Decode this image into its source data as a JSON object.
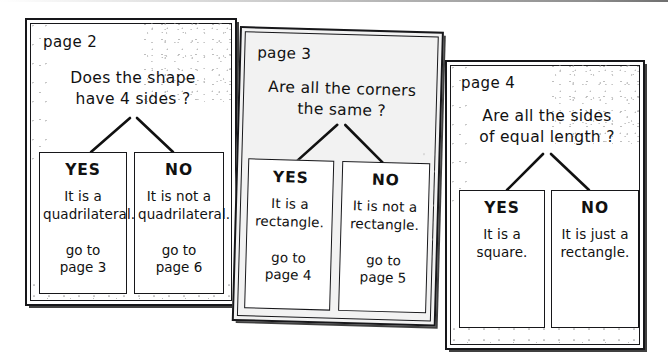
{
  "figure": {
    "kind": "flowchart-pages-scan",
    "ink_color": "#111111",
    "paper_color": "#ffffff",
    "page3_paper_color": "#f2f2f2"
  },
  "cards": [
    {
      "id": "page2",
      "page_label": "page 2",
      "question": "Does the shape\nhave 4 sides ?",
      "answers": [
        {
          "head": "YES",
          "body": "It is a\nquadrilateral.",
          "goto": "go to\npage 3"
        },
        {
          "head": "NO",
          "body": "It is not a\nquadrilateral.",
          "goto": "go to\npage 6"
        }
      ]
    },
    {
      "id": "page3",
      "page_label": "page 3",
      "question": "Are all the corners\nthe same ?",
      "answers": [
        {
          "head": "YES",
          "body": "It is a\nrectangle.",
          "goto": "go to\npage 4"
        },
        {
          "head": "NO",
          "body": "It is not a\nrectangle.",
          "goto": "go to\npage 5"
        }
      ]
    },
    {
      "id": "page4",
      "page_label": "page 4",
      "question": "Are all the sides\nof equal length ?",
      "answers": [
        {
          "head": "YES",
          "body": "It is a\nsquare.",
          "goto": ""
        },
        {
          "head": "NO",
          "body": "It is just a\nrectangle.",
          "goto": ""
        }
      ]
    }
  ]
}
